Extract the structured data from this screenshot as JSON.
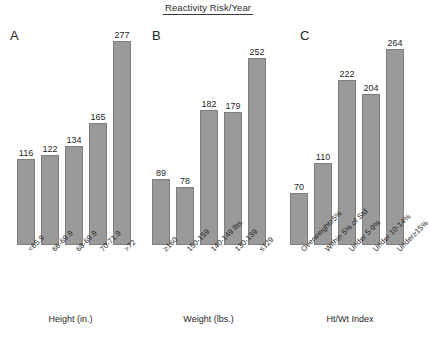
{
  "title": "Reactivity Risk/Year",
  "panels": [
    {
      "letter": "A",
      "axis_title": "Height (in.)",
      "categories": [
        "<65.9",
        "66-69.9",
        "68-69.9",
        "70-71.9",
        ">72"
      ],
      "values": [
        116,
        122,
        134,
        165,
        277
      ]
    },
    {
      "letter": "B",
      "axis_title": "Weight (lbs.)",
      "categories": [
        "≥160",
        "150-159",
        "140-149 lbs.",
        "130-139",
        "≤129"
      ],
      "values": [
        89,
        78,
        182,
        179,
        252
      ]
    },
    {
      "letter": "C",
      "axis_title": "Ht/Wt Index",
      "categories": [
        "Overweight≥5%",
        "Within 5% of Std",
        "Under 5-9%",
        "Under 10-14%",
        "Under≥15%"
      ],
      "values": [
        70,
        110,
        222,
        204,
        264
      ]
    }
  ],
  "chart_data": {
    "type": "bar",
    "title": "Reactivity Risk/Year",
    "xlabel": "",
    "ylabel": "",
    "ylim": [
      0,
      290
    ],
    "grid": false,
    "legend": "none",
    "bar_color": "#9a9a9a",
    "panels": [
      {
        "panel": "A",
        "title": "",
        "xlabel": "Height (in.)",
        "ylabel": "",
        "categories": [
          "<65.9",
          "66-69.9",
          "68-69.9",
          "70-71.9",
          ">72"
        ],
        "values": [
          116,
          122,
          134,
          165,
          277
        ],
        "data_labels": [
          "116",
          "122",
          "134",
          "165",
          "277"
        ]
      },
      {
        "panel": "B",
        "title": "",
        "xlabel": "Weight (lbs.)",
        "ylabel": "",
        "categories": [
          "≥160",
          "150-159",
          "140-149 lbs.",
          "130-139",
          "≤129"
        ],
        "values": [
          89,
          78,
          182,
          179,
          252
        ],
        "data_labels": [
          "89",
          "78",
          "182",
          "179",
          "252"
        ]
      },
      {
        "panel": "C",
        "title": "",
        "xlabel": "Ht/Wt Index",
        "ylabel": "",
        "categories": [
          "Overweight≥5%",
          "Within 5% of Std",
          "Under 5-9%",
          "Under 10-14%",
          "Under≥15%"
        ],
        "values": [
          70,
          110,
          222,
          204,
          264
        ],
        "data_labels": [
          "70",
          "110",
          "222",
          "204",
          "264"
        ]
      }
    ]
  }
}
